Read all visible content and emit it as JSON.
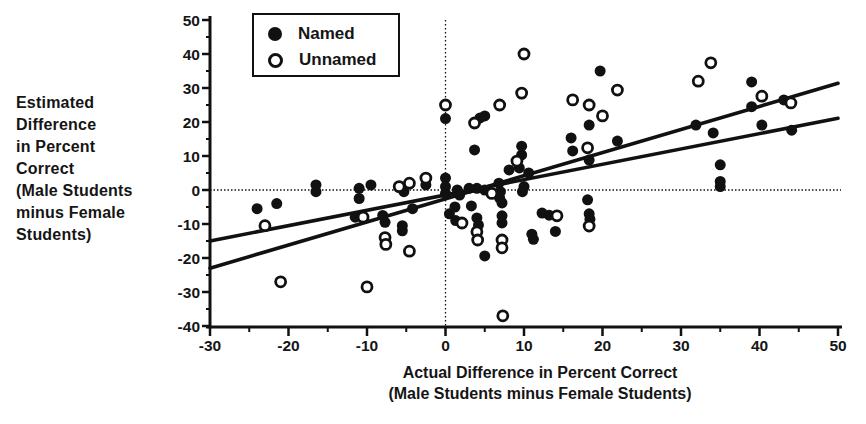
{
  "figure": {
    "y_axis_label_lines": [
      "Estimated",
      "Difference",
      "in Percent",
      "Correct",
      "(Male Students",
      "minus Female",
      "Students)"
    ],
    "x_axis_label_lines": [
      "Actual Difference in Percent Correct",
      "(Male Students minus Female Students)"
    ],
    "legend": {
      "items": [
        {
          "label": "Named",
          "marker": "filled-circle"
        },
        {
          "label": "Unnamed",
          "marker": "open-circle"
        }
      ]
    }
  },
  "chart_data": {
    "type": "scatter",
    "title": "",
    "xlabel": "Actual Difference in Percent Correct (Male Students minus Female Students)",
    "ylabel": "Estimated Difference in Percent Correct (Male Students minus Female Students)",
    "xlim": [
      -30,
      50
    ],
    "ylim": [
      -40,
      50
    ],
    "x_ticks": [
      -30,
      -20,
      -10,
      0,
      10,
      20,
      30,
      40,
      50
    ],
    "y_ticks": [
      -40,
      -30,
      -20,
      -10,
      0,
      10,
      20,
      30,
      40,
      50
    ],
    "minor_tick_step": 5,
    "grid": false,
    "legend_position": "top-left-inside",
    "reference_lines": {
      "vertical_x": 0,
      "horizontal_y": 0
    },
    "colors": {
      "ink": "#111111",
      "background": "#ffffff"
    },
    "series": [
      {
        "name": "Named",
        "marker": "filled-circle",
        "points": [
          [
            -24,
            -5.5
          ],
          [
            -21.5,
            -4
          ],
          [
            -16.5,
            1.5
          ],
          [
            -16.5,
            -0.5
          ],
          [
            -11.5,
            -8
          ],
          [
            -11,
            0.5
          ],
          [
            -11,
            -2.5
          ],
          [
            -9.5,
            1.5
          ],
          [
            -8,
            -7.5
          ],
          [
            -7.7,
            -9.5
          ],
          [
            -5.5,
            -10.5
          ],
          [
            -5.5,
            -12
          ],
          [
            -5.3,
            -0.5
          ],
          [
            -4.2,
            -5.5
          ],
          [
            -2.5,
            1.5
          ],
          [
            0,
            21
          ],
          [
            0,
            3.5
          ],
          [
            0,
            1
          ],
          [
            0,
            -1
          ],
          [
            0.5,
            -7
          ],
          [
            1.2,
            -5
          ],
          [
            1.3,
            -9
          ],
          [
            1.5,
            0
          ],
          [
            1.8,
            -1.5
          ],
          [
            3,
            0.5
          ],
          [
            3.3,
            -4.7
          ],
          [
            3.7,
            11.8
          ],
          [
            4,
            0.5
          ],
          [
            4,
            -8.2
          ],
          [
            4.2,
            -10.3
          ],
          [
            4.4,
            21.2
          ],
          [
            5,
            21.8
          ],
          [
            5,
            0
          ],
          [
            5,
            -19.4
          ],
          [
            6.8,
            2
          ],
          [
            6.9,
            -2.4
          ],
          [
            7,
            -0.5
          ],
          [
            7.2,
            -3.8
          ],
          [
            7.2,
            -7.6
          ],
          [
            7.2,
            -9.7
          ],
          [
            8.1,
            5.9
          ],
          [
            9.4,
            6.5
          ],
          [
            9.7,
            12.9
          ],
          [
            9.7,
            10.3
          ],
          [
            9.8,
            -0.5
          ],
          [
            10,
            1
          ],
          [
            10.6,
            5
          ],
          [
            11,
            -13
          ],
          [
            11.2,
            -14.5
          ],
          [
            12.3,
            -6.8
          ],
          [
            13.2,
            -7.4
          ],
          [
            14,
            -12.2
          ],
          [
            16,
            15.3
          ],
          [
            16.2,
            11.5
          ],
          [
            18.1,
            -2.9
          ],
          [
            18.3,
            19.1
          ],
          [
            18.3,
            8.8
          ],
          [
            18.3,
            -7
          ],
          [
            18.4,
            -8.6
          ],
          [
            19.7,
            35
          ],
          [
            21.9,
            14.4
          ],
          [
            31.9,
            19.1
          ],
          [
            34.1,
            16.8
          ],
          [
            35,
            7.4
          ],
          [
            35,
            2.5
          ],
          [
            35,
            1
          ],
          [
            39,
            31.8
          ],
          [
            39,
            24.5
          ],
          [
            40.3,
            19.1
          ],
          [
            43.1,
            26.5
          ],
          [
            44.1,
            17.6
          ]
        ]
      },
      {
        "name": "Unnamed",
        "marker": "open-circle",
        "points": [
          [
            -23,
            -10.5
          ],
          [
            -21,
            -27
          ],
          [
            -10.5,
            -8
          ],
          [
            -10,
            -28.5
          ],
          [
            -7.7,
            -14
          ],
          [
            -7.6,
            -16
          ],
          [
            -5.9,
            1
          ],
          [
            -4.6,
            2
          ],
          [
            -4.6,
            -18
          ],
          [
            -2.5,
            3.5
          ],
          [
            0,
            25
          ],
          [
            2.1,
            -9.7
          ],
          [
            3.7,
            19.7
          ],
          [
            4,
            -12.3
          ],
          [
            4.1,
            -14.7
          ],
          [
            5.9,
            -1
          ],
          [
            6.9,
            25
          ],
          [
            7.2,
            -14.7
          ],
          [
            7.2,
            -17
          ],
          [
            7.3,
            -37
          ],
          [
            9.1,
            8.5
          ],
          [
            9.7,
            28.5
          ],
          [
            10,
            40
          ],
          [
            14.2,
            -7.6
          ],
          [
            16.2,
            26.5
          ],
          [
            18.1,
            12.4
          ],
          [
            18.3,
            25
          ],
          [
            18.3,
            -10.6
          ],
          [
            20,
            21.8
          ],
          [
            21.9,
            29.4
          ],
          [
            32.2,
            32
          ],
          [
            33.8,
            37.4
          ],
          [
            40.3,
            27.6
          ],
          [
            44,
            25.6
          ]
        ]
      }
    ],
    "fit_lines": [
      {
        "name": "steeper-fit-line",
        "x1": -30,
        "y1": -23,
        "x2": 50,
        "y2": 31.4
      },
      {
        "name": "shallower-fit-line",
        "x1": -30,
        "y1": -15,
        "x2": 50,
        "y2": 21.1
      }
    ]
  }
}
